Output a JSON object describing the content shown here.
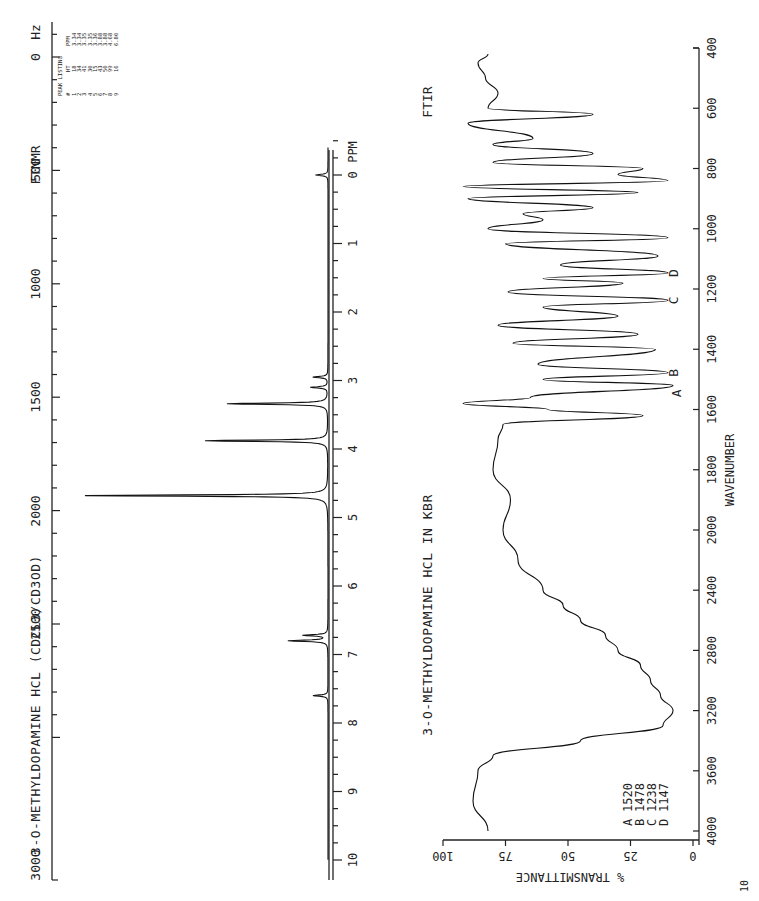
{
  "nmr": {
    "technique_label": "FTNMR",
    "title": "3-O-METHYLDOPAMINE HCL (CDCL3/CD3OD)",
    "hz_axis_label": "Hz",
    "ppm_axis_label": "PPM",
    "hz_ticks": [
      "0",
      "500",
      "1000",
      "1500",
      "2000",
      "2500",
      "3000"
    ],
    "ppm_ticks": [
      "0",
      "1",
      "2",
      "3",
      "4",
      "5",
      "6",
      "7",
      "8",
      "9",
      "10"
    ],
    "peak_listing": {
      "title": "PEAK LISTING",
      "headers": [
        "#",
        "HT",
        "PPM"
      ],
      "rows": [
        [
          "1",
          "18",
          "3.34"
        ],
        [
          "2",
          "34",
          "3.34"
        ],
        [
          "3",
          "41",
          "3.35"
        ],
        [
          "4",
          "30",
          "3.35"
        ],
        [
          "5",
          "15",
          "3.36"
        ],
        [
          "6",
          "43",
          "3.88"
        ],
        [
          "7",
          "50",
          "3.88"
        ],
        [
          "8",
          "99",
          "4.68"
        ],
        [
          "9",
          "16",
          "6.80"
        ]
      ]
    }
  },
  "ir": {
    "technique_label": "FTIR",
    "title": "3-O-METHYLDOPAMINE HCL IN KBR",
    "x_axis_label": "WAVENUMBER",
    "y_axis_label": "% TRANSMITTANCE",
    "x_ticks": [
      "400",
      "600",
      "800",
      "1000",
      "1200",
      "1400",
      "1600",
      "1800",
      "2000",
      "2400",
      "2800",
      "3200",
      "3600",
      "4000"
    ],
    "y_ticks": [
      "0",
      "25",
      "50",
      "75",
      "100"
    ],
    "peak_markers": [
      "A",
      "B",
      "C",
      "D"
    ],
    "peak_table": [
      {
        "label": "A",
        "value": "1520"
      },
      {
        "label": "B",
        "value": "1478"
      },
      {
        "label": "C",
        "value": "1238"
      },
      {
        "label": "D",
        "value": "1147"
      }
    ]
  },
  "chart_data": [
    {
      "type": "line",
      "title": "3-O-METHYLDOPAMINE HCL (CDCL3/CD3OD)",
      "subtitle": "FTNMR",
      "xlabel": "PPM",
      "secondary_xlabel": "Hz",
      "ylabel": "",
      "xlim": [
        10,
        0
      ],
      "secondary_xlim": [
        3000,
        0
      ],
      "grid": false,
      "orientation": "rotated 90 degrees (page landscape)",
      "peaks": [
        {
          "ppm": 0.0,
          "relative_height": 5,
          "note": "TMS reference"
        },
        {
          "ppm": 2.95,
          "relative_height": 6,
          "note": "multiplet"
        },
        {
          "ppm": 3.1,
          "relative_height": 7,
          "note": "multiplet"
        },
        {
          "ppm": 3.34,
          "relative_height": 41
        },
        {
          "ppm": 3.88,
          "relative_height": 50
        },
        {
          "ppm": 4.68,
          "relative_height": 99
        },
        {
          "ppm": 6.72,
          "relative_height": 10
        },
        {
          "ppm": 6.8,
          "relative_height": 16
        },
        {
          "ppm": 7.6,
          "relative_height": 6
        }
      ],
      "table": {
        "headers": [
          "#",
          "HT",
          "PPM"
        ],
        "rows": [
          [
            1,
            18,
            3.34
          ],
          [
            2,
            34,
            3.34
          ],
          [
            3,
            41,
            3.35
          ],
          [
            4,
            30,
            3.35
          ],
          [
            5,
            15,
            3.36
          ],
          [
            6,
            43,
            3.88
          ],
          [
            7,
            50,
            3.88
          ],
          [
            8,
            99,
            4.68
          ],
          [
            9,
            16,
            6.8
          ]
        ]
      }
    },
    {
      "type": "line",
      "title": "3-O-METHYLDOPAMINE HCL IN KBR",
      "subtitle": "FTIR",
      "xlabel": "WAVENUMBER",
      "ylabel": "% TRANSMITTANCE",
      "xlim": [
        4000,
        400
      ],
      "ylim": [
        0,
        100
      ],
      "grid": false,
      "x": [
        4000,
        3800,
        3600,
        3500,
        3400,
        3300,
        3200,
        3100,
        3000,
        2900,
        2800,
        2700,
        2600,
        2500,
        2400,
        2200,
        2000,
        1900,
        1800,
        1700,
        1650,
        1620,
        1600,
        1580,
        1560,
        1520,
        1500,
        1478,
        1450,
        1400,
        1380,
        1350,
        1320,
        1290,
        1260,
        1238,
        1210,
        1180,
        1165,
        1147,
        1120,
        1090,
        1050,
        1030,
        1000,
        970,
        950,
        930,
        900,
        880,
        860,
        840,
        820,
        800,
        780,
        750,
        720,
        700,
        650,
        620,
        600,
        550,
        500,
        450,
        420
      ],
      "series": [
        {
          "name": "%T",
          "values": [
            82,
            88,
            86,
            80,
            45,
            12,
            8,
            13,
            17,
            21,
            30,
            35,
            45,
            52,
            60,
            70,
            76,
            73,
            80,
            78,
            76,
            20,
            58,
            92,
            65,
            8,
            60,
            10,
            62,
            15,
            72,
            22,
            78,
            30,
            60,
            10,
            74,
            28,
            60,
            10,
            53,
            14,
            75,
            10,
            82,
            60,
            68,
            40,
            90,
            22,
            92,
            10,
            30,
            20,
            80,
            40,
            80,
            64,
            90,
            40,
            82,
            78,
            83,
            86,
            82
          ]
        }
      ],
      "annotations": [
        {
          "label": "A",
          "wavenumber": 1520
        },
        {
          "label": "B",
          "wavenumber": 1478
        },
        {
          "label": "C",
          "wavenumber": 1238
        },
        {
          "label": "D",
          "wavenumber": 1147
        }
      ]
    }
  ]
}
